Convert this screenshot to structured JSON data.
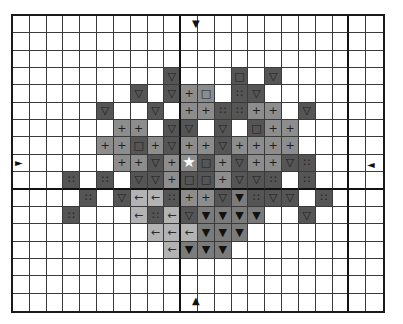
{
  "chart": {
    "kind": "cross-stitch pattern chart",
    "columns": 22,
    "rows": 17,
    "bold_grid_every": 10,
    "colors": {
      "empty": "#ffffff",
      "dark": "#555555",
      "medium": "#8d8d8d",
      "medium_dark": "#7b7b7b",
      "light": "#b3b3b3",
      "grid_line": "#3a3a3a"
    },
    "legend_symbols": {
      "D▽": {
        "shade": "dark",
        "symbol": "▽",
        "icon": "triangle-down-outline-icon"
      },
      "D□": {
        "shade": "dark",
        "symbol": "□",
        "icon": "square-outline-icon"
      },
      "D∷": {
        "shade": "dark",
        "symbol": "∷",
        "icon": "four-dots-icon"
      },
      "M+": {
        "shade": "medium",
        "symbol": "+",
        "icon": "plus-icon"
      },
      "M□": {
        "shade": "medium",
        "symbol": "□",
        "icon": "square-outline-icon"
      },
      "N▼": {
        "shade": "medium_dark",
        "symbol": "▼",
        "icon": "triangle-down-filled-icon"
      },
      "L←": {
        "shade": "light",
        "symbol": "←",
        "icon": "arrow-left-icon"
      },
      "M★": {
        "shade": "medium",
        "symbol": "★",
        "icon": "star-icon"
      }
    },
    "center_markers": {
      "top": {
        "symbol": "▼",
        "x": 197,
        "y": 25
      },
      "bottom": {
        "symbol": "▲",
        "x": 197,
        "y": 302
      },
      "left": {
        "symbol": "►",
        "x": 20,
        "y": 164
      },
      "right": {
        "symbol": "◄",
        "x": 373,
        "y": 166
      }
    },
    "cells": [
      {
        "r": 3,
        "c": 9,
        "t": "D▽"
      },
      {
        "r": 3,
        "c": 13,
        "t": "D□"
      },
      {
        "r": 3,
        "c": 15,
        "t": "D▽"
      },
      {
        "r": 4,
        "c": 7,
        "t": "D▽"
      },
      {
        "r": 4,
        "c": 9,
        "t": "D▽"
      },
      {
        "r": 4,
        "c": 10,
        "t": "M+"
      },
      {
        "r": 4,
        "c": 11,
        "t": "M□"
      },
      {
        "r": 4,
        "c": 13,
        "t": "D∷"
      },
      {
        "r": 4,
        "c": 14,
        "t": "D▽"
      },
      {
        "r": 5,
        "c": 5,
        "t": "D▽"
      },
      {
        "r": 5,
        "c": 8,
        "t": "D▽"
      },
      {
        "r": 5,
        "c": 10,
        "t": "M+"
      },
      {
        "r": 5,
        "c": 11,
        "t": "M+"
      },
      {
        "r": 5,
        "c": 12,
        "t": "D∷"
      },
      {
        "r": 5,
        "c": 13,
        "t": "D∷"
      },
      {
        "r": 5,
        "c": 14,
        "t": "M+"
      },
      {
        "r": 5,
        "c": 15,
        "t": "M+"
      },
      {
        "r": 5,
        "c": 17,
        "t": "D▽"
      },
      {
        "r": 6,
        "c": 6,
        "t": "M+"
      },
      {
        "r": 6,
        "c": 7,
        "t": "M+"
      },
      {
        "r": 6,
        "c": 9,
        "t": "D▽"
      },
      {
        "r": 6,
        "c": 10,
        "t": "D▽"
      },
      {
        "r": 6,
        "c": 12,
        "t": "D▽"
      },
      {
        "r": 6,
        "c": 14,
        "t": "D□"
      },
      {
        "r": 6,
        "c": 15,
        "t": "M+"
      },
      {
        "r": 6,
        "c": 16,
        "t": "M+"
      },
      {
        "r": 7,
        "c": 5,
        "t": "M+"
      },
      {
        "r": 7,
        "c": 6,
        "t": "M+"
      },
      {
        "r": 7,
        "c": 7,
        "t": "D□"
      },
      {
        "r": 7,
        "c": 8,
        "t": "M+"
      },
      {
        "r": 7,
        "c": 9,
        "t": "D▽"
      },
      {
        "r": 7,
        "c": 10,
        "t": "M+"
      },
      {
        "r": 7,
        "c": 11,
        "t": "M+"
      },
      {
        "r": 7,
        "c": 12,
        "t": "D▽"
      },
      {
        "r": 7,
        "c": 13,
        "t": "M+"
      },
      {
        "r": 7,
        "c": 14,
        "t": "M+"
      },
      {
        "r": 7,
        "c": 15,
        "t": "M+"
      },
      {
        "r": 7,
        "c": 16,
        "t": "M+"
      },
      {
        "r": 8,
        "c": 6,
        "t": "M+"
      },
      {
        "r": 8,
        "c": 7,
        "t": "M+"
      },
      {
        "r": 8,
        "c": 8,
        "t": "D▽"
      },
      {
        "r": 8,
        "c": 9,
        "t": "M+"
      },
      {
        "r": 8,
        "c": 10,
        "t": "M★"
      },
      {
        "r": 8,
        "c": 11,
        "t": "D□"
      },
      {
        "r": 8,
        "c": 12,
        "t": "M+"
      },
      {
        "r": 8,
        "c": 13,
        "t": "D▽"
      },
      {
        "r": 8,
        "c": 14,
        "t": "M+"
      },
      {
        "r": 8,
        "c": 15,
        "t": "M+"
      },
      {
        "r": 8,
        "c": 16,
        "t": "D▽"
      },
      {
        "r": 8,
        "c": 17,
        "t": "D∷"
      },
      {
        "r": 9,
        "c": 3,
        "t": "D∷"
      },
      {
        "r": 9,
        "c": 5,
        "t": "D∷"
      },
      {
        "r": 9,
        "c": 7,
        "t": "D▽"
      },
      {
        "r": 9,
        "c": 8,
        "t": "D▽"
      },
      {
        "r": 9,
        "c": 9,
        "t": "M+"
      },
      {
        "r": 9,
        "c": 10,
        "t": "D□"
      },
      {
        "r": 9,
        "c": 11,
        "t": "D□"
      },
      {
        "r": 9,
        "c": 12,
        "t": "M+"
      },
      {
        "r": 9,
        "c": 13,
        "t": "D▽"
      },
      {
        "r": 9,
        "c": 14,
        "t": "D▽"
      },
      {
        "r": 9,
        "c": 15,
        "t": "D∷"
      },
      {
        "r": 9,
        "c": 17,
        "t": "D∷"
      },
      {
        "r": 10,
        "c": 4,
        "t": "D∷"
      },
      {
        "r": 10,
        "c": 6,
        "t": "D▽"
      },
      {
        "r": 10,
        "c": 7,
        "t": "L←"
      },
      {
        "r": 10,
        "c": 8,
        "t": "L←"
      },
      {
        "r": 10,
        "c": 9,
        "t": "D∷"
      },
      {
        "r": 10,
        "c": 10,
        "t": "M+"
      },
      {
        "r": 10,
        "c": 11,
        "t": "M+"
      },
      {
        "r": 10,
        "c": 12,
        "t": "D▽"
      },
      {
        "r": 10,
        "c": 13,
        "t": "N▼"
      },
      {
        "r": 10,
        "c": 14,
        "t": "D∷"
      },
      {
        "r": 10,
        "c": 15,
        "t": "D▽"
      },
      {
        "r": 10,
        "c": 16,
        "t": "D▽"
      },
      {
        "r": 10,
        "c": 18,
        "t": "D∷"
      },
      {
        "r": 11,
        "c": 3,
        "t": "D∷"
      },
      {
        "r": 11,
        "c": 7,
        "t": "L←"
      },
      {
        "r": 11,
        "c": 8,
        "t": "D∷"
      },
      {
        "r": 11,
        "c": 9,
        "t": "L←"
      },
      {
        "r": 11,
        "c": 10,
        "t": "D▽"
      },
      {
        "r": 11,
        "c": 11,
        "t": "N▼"
      },
      {
        "r": 11,
        "c": 12,
        "t": "N▼"
      },
      {
        "r": 11,
        "c": 13,
        "t": "N▼"
      },
      {
        "r": 11,
        "c": 14,
        "t": "N▼"
      },
      {
        "r": 11,
        "c": 17,
        "t": "D▽"
      },
      {
        "r": 12,
        "c": 8,
        "t": "L←"
      },
      {
        "r": 12,
        "c": 9,
        "t": "L←"
      },
      {
        "r": 12,
        "c": 10,
        "t": "L←"
      },
      {
        "r": 12,
        "c": 11,
        "t": "N▼"
      },
      {
        "r": 12,
        "c": 12,
        "t": "N▼"
      },
      {
        "r": 12,
        "c": 13,
        "t": "N▼"
      },
      {
        "r": 13,
        "c": 9,
        "t": "L←"
      },
      {
        "r": 13,
        "c": 10,
        "t": "N▼"
      },
      {
        "r": 13,
        "c": 11,
        "t": "N▼"
      },
      {
        "r": 13,
        "c": 12,
        "t": "N▼"
      }
    ]
  }
}
